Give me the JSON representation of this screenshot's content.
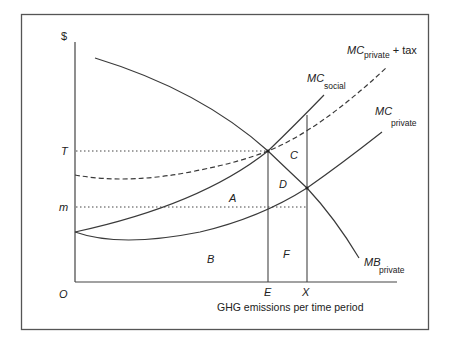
{
  "diagram": {
    "title": "",
    "y_axis_label": "$",
    "x_axis_label": "GHG emissions per time period",
    "origin_label": "O",
    "price_labels": {
      "T": "T",
      "m": "m"
    },
    "quantity_labels": {
      "E": "E",
      "X": "X"
    },
    "area_labels": {
      "A": "A",
      "B": "B",
      "C": "C",
      "D": "D",
      "F": "F"
    },
    "curves": {
      "mc_social": {
        "main": "MC",
        "sub": "social"
      },
      "mc_private": {
        "main": "MC",
        "sub": "private"
      },
      "mc_private_tax": {
        "main": "MC",
        "sub": "private",
        "suffix": " + tax"
      },
      "mb_private": {
        "main": "MB",
        "sub": "private"
      }
    },
    "colors": {
      "line": "#3a3a3a",
      "frame": "#555555",
      "background": "#ffffff"
    }
  }
}
